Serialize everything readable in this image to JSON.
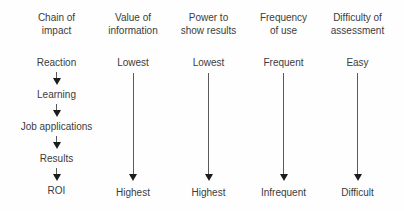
{
  "diagram": {
    "colors": {
      "background": "#ffffff",
      "text": "#3c3c3c",
      "arrow_shaft": "#5a5a5a",
      "arrow_head": "#1c1c1c"
    },
    "columns": [
      {
        "header_line1": "Chain of",
        "header_line2": "impact",
        "chain": [
          "Reaction",
          "Learning",
          "Job applications",
          "Results",
          "ROI"
        ]
      },
      {
        "header_line1": "Value of",
        "header_line2": "information",
        "top": "Lowest",
        "bottom": "Highest"
      },
      {
        "header_line1": "Power to",
        "header_line2": "show results",
        "top": "Lowest",
        "bottom": "Highest"
      },
      {
        "header_line1": "Frequency",
        "header_line2": "of use",
        "top": "Frequent",
        "bottom": "Infrequent"
      },
      {
        "header_line1": "Difficulty of",
        "header_line2": "assessment",
        "top": "Easy",
        "bottom": "Difficult"
      }
    ]
  }
}
